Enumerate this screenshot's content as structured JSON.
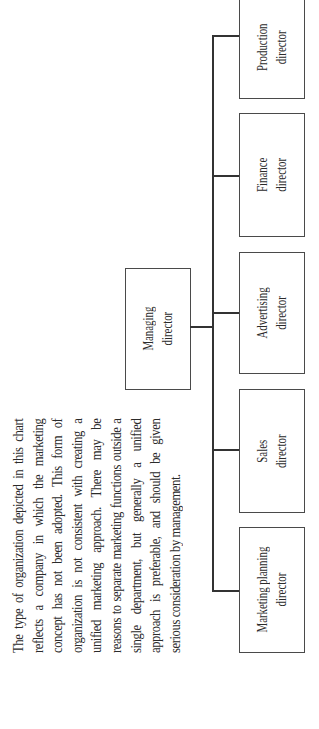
{
  "description": {
    "lines": [
      "The type of organization depicted in this",
      "chart reflects a company in which the",
      "marketing concept has not been adopted.",
      "This form of organization is not consistent",
      "with creating a unified marketing approach.",
      "There may be reasons to separate marketing",
      "functions outside a single department, but",
      "generally a unified approach is preferable,",
      "and should be given serious consideration",
      "by management."
    ],
    "text": "The type of organization depicted in this chart reflects a company in which the marketing concept has not been adopted. This form of organization is not consistent with creating a unified marketing approach. There may be reasons to separate marketing functions outside a single department, but generally a unified approach is preferable, and should be given serious consideration by management."
  },
  "org_chart": {
    "root": {
      "line1": "Managing",
      "line2": "director"
    },
    "children": [
      {
        "line1": "Marketing planning",
        "line2": "director"
      },
      {
        "line1": "Sales",
        "line2": "director"
      },
      {
        "line1": "Advertising",
        "line2": "director"
      },
      {
        "line1": "Finance",
        "line2": "director"
      },
      {
        "line1": "Production",
        "line2": "director"
      }
    ]
  },
  "colors": {
    "line": "#333333",
    "border": "#4a4a4a",
    "text": "#2b2b2b",
    "background": "#ffffff"
  }
}
